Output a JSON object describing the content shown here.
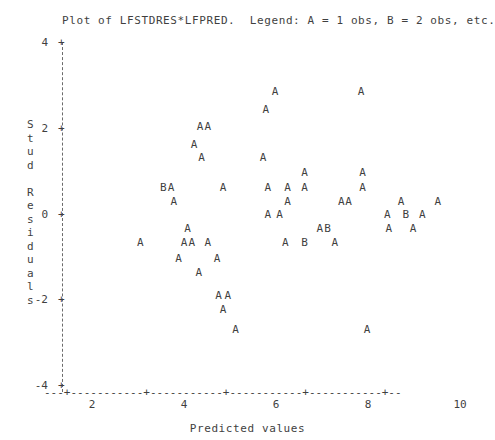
{
  "title": "Plot of LFSTDRES*LFPRED.  Legend: A = 1 obs, B = 2 obs, etc.",
  "axes": {
    "xlabel": "Predicted values",
    "ylabel_chars": [
      "S",
      "t",
      "u",
      "d",
      " ",
      "R",
      "e",
      "s",
      "i",
      "d",
      "u",
      "a",
      "l",
      "s"
    ],
    "ylabel_text": "Stud Residuals",
    "ytick_labels": [
      "4",
      "2",
      "0",
      "-2",
      "-4"
    ],
    "xtick_labels": [
      "2",
      "4",
      "6",
      "8",
      "10"
    ],
    "xaxis_line": "---+-----------+-----------+-----------+-----------+--",
    "ytick_mark": "+",
    "yaxis_tick_glyph": "|"
  },
  "chart_data": {
    "type": "scatter",
    "title": "Plot of LFSTDRES*LFPRED.  Legend: A = 1 obs, B = 2 obs, etc.",
    "xlabel": "Predicted values",
    "ylabel": "Stud Residuals",
    "xlim": [
      1.6,
      10.4
    ],
    "ylim": [
      -4,
      4
    ],
    "xticks": [
      2,
      4,
      6,
      8,
      10
    ],
    "yticks": [
      -4,
      -2,
      0,
      2,
      4
    ],
    "grid": false,
    "legend": "A = 1 obs, B = 2 obs, etc.",
    "marker_legend": {
      "A": 1,
      "B": 2
    },
    "points": [
      {
        "x": 5.98,
        "y": 2.85,
        "m": "A"
      },
      {
        "x": 7.85,
        "y": 2.85,
        "m": "A"
      },
      {
        "x": 5.78,
        "y": 2.43,
        "m": "A"
      },
      {
        "x": 4.35,
        "y": 2.05,
        "m": "A"
      },
      {
        "x": 4.52,
        "y": 2.05,
        "m": "A"
      },
      {
        "x": 4.22,
        "y": 1.62,
        "m": "A"
      },
      {
        "x": 4.38,
        "y": 1.32,
        "m": "A"
      },
      {
        "x": 5.72,
        "y": 1.32,
        "m": "A"
      },
      {
        "x": 6.62,
        "y": 0.96,
        "m": "A"
      },
      {
        "x": 7.88,
        "y": 0.96,
        "m": "A"
      },
      {
        "x": 3.55,
        "y": 0.62,
        "m": "B"
      },
      {
        "x": 3.72,
        "y": 0.62,
        "m": "A"
      },
      {
        "x": 4.85,
        "y": 0.62,
        "m": "A"
      },
      {
        "x": 5.82,
        "y": 0.62,
        "m": "A"
      },
      {
        "x": 6.25,
        "y": 0.62,
        "m": "A"
      },
      {
        "x": 6.62,
        "y": 0.62,
        "m": "A"
      },
      {
        "x": 7.88,
        "y": 0.62,
        "m": "A"
      },
      {
        "x": 3.78,
        "y": 0.3,
        "m": "A"
      },
      {
        "x": 6.25,
        "y": 0.3,
        "m": "A"
      },
      {
        "x": 7.42,
        "y": 0.3,
        "m": "A"
      },
      {
        "x": 7.58,
        "y": 0.3,
        "m": "A"
      },
      {
        "x": 8.72,
        "y": 0.3,
        "m": "A"
      },
      {
        "x": 9.52,
        "y": 0.3,
        "m": "A"
      },
      {
        "x": 5.82,
        "y": -0.02,
        "m": "A"
      },
      {
        "x": 6.08,
        "y": -0.02,
        "m": "A"
      },
      {
        "x": 8.42,
        "y": -0.02,
        "m": "A"
      },
      {
        "x": 8.82,
        "y": -0.02,
        "m": "B"
      },
      {
        "x": 9.18,
        "y": -0.02,
        "m": "A"
      },
      {
        "x": 4.08,
        "y": -0.34,
        "m": "A"
      },
      {
        "x": 6.95,
        "y": -0.34,
        "m": "A"
      },
      {
        "x": 7.12,
        "y": -0.34,
        "m": "B"
      },
      {
        "x": 8.45,
        "y": -0.34,
        "m": "A"
      },
      {
        "x": 8.98,
        "y": -0.34,
        "m": "A"
      },
      {
        "x": 3.05,
        "y": -0.66,
        "m": "A"
      },
      {
        "x": 4.0,
        "y": -0.66,
        "m": "A"
      },
      {
        "x": 4.17,
        "y": -0.66,
        "m": "A"
      },
      {
        "x": 4.52,
        "y": -0.66,
        "m": "A"
      },
      {
        "x": 6.2,
        "y": -0.66,
        "m": "A"
      },
      {
        "x": 6.62,
        "y": -0.66,
        "m": "B"
      },
      {
        "x": 7.28,
        "y": -0.66,
        "m": "A"
      },
      {
        "x": 3.88,
        "y": -1.04,
        "m": "A"
      },
      {
        "x": 4.72,
        "y": -1.04,
        "m": "A"
      },
      {
        "x": 4.32,
        "y": -1.36,
        "m": "A"
      },
      {
        "x": 4.75,
        "y": -1.9,
        "m": "A"
      },
      {
        "x": 4.95,
        "y": -1.9,
        "m": "A"
      },
      {
        "x": 4.85,
        "y": -2.22,
        "m": "A"
      },
      {
        "x": 5.12,
        "y": -2.7,
        "m": "A"
      },
      {
        "x": 7.98,
        "y": -2.7,
        "m": "A"
      }
    ]
  }
}
